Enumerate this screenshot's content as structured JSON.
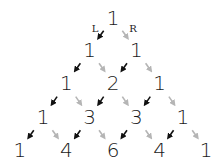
{
  "labels": {
    "left": "L",
    "right": "R"
  },
  "colors": {
    "number": "#1a1a1a",
    "left_arrow": "#111111",
    "right_arrow": "#b5b5b5"
  },
  "rows": [
    [
      "1"
    ],
    [
      "1",
      "1"
    ],
    [
      "1",
      "2",
      "1"
    ],
    [
      "1",
      "3",
      "3",
      "1"
    ],
    [
      "1",
      "4",
      "6",
      "4",
      "1"
    ]
  ],
  "layout": {
    "center_x": 113,
    "col_step": 23.3,
    "row_y": [
      18,
      50,
      83,
      117,
      150
    ]
  }
}
